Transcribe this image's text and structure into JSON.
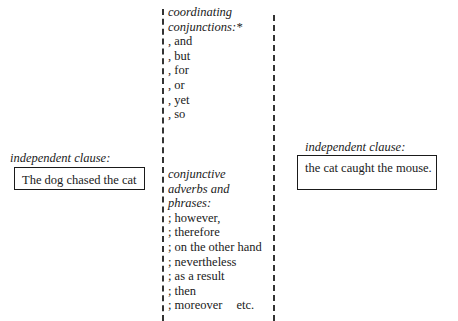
{
  "left": {
    "label": "independent clause:",
    "text": "The dog chased the cat"
  },
  "right": {
    "label": "independent clause:",
    "text": "the cat caught the mouse."
  },
  "middle": {
    "coordinating": {
      "heading_line1": "coordinating",
      "heading_line2": "conjunctions:*",
      "items": [
        ", and",
        ", but",
        ", for",
        ", or",
        ", yet",
        ", so"
      ]
    },
    "adverbs": {
      "heading_line1": "conjunctive",
      "heading_line2": "adverbs and",
      "heading_line3": "phrases:",
      "items": [
        "; however,",
        "; therefore",
        "; on the other hand",
        "; nevertheless",
        "; as a result",
        "; then",
        "; moreover"
      ],
      "trailing": "etc."
    }
  }
}
